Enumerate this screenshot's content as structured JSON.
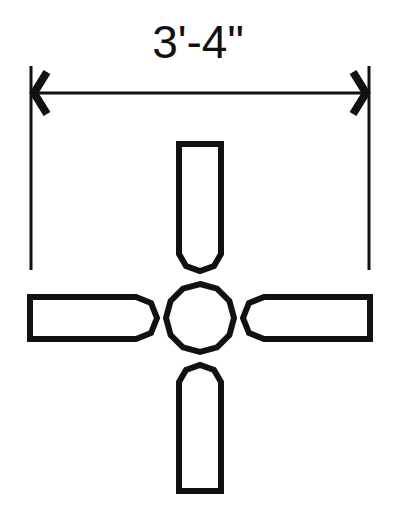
{
  "drawing": {
    "title": "Ceiling fan plan view",
    "dimension_label": "3'-4\"",
    "colors": {
      "line": "#111111",
      "background": "#ffffff"
    },
    "blades": [
      "top",
      "right",
      "bottom",
      "left"
    ],
    "hub_shape": "12-sided polygon"
  }
}
